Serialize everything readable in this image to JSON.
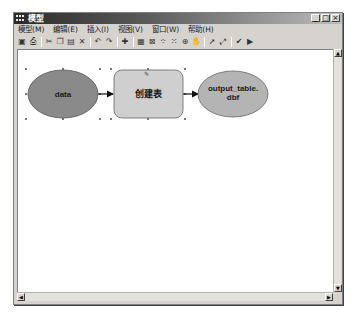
{
  "window": {
    "title": "模型",
    "controls": {
      "minimize": "_",
      "maximize": "□",
      "close": "×"
    }
  },
  "menubar": {
    "items": [
      {
        "label": "模型(M)"
      },
      {
        "label": "编辑(E)"
      },
      {
        "label": "插入(I)"
      },
      {
        "label": "视图(V)"
      },
      {
        "label": "窗口(W)"
      },
      {
        "label": "帮助(H)"
      }
    ]
  },
  "toolbar": {
    "groups": [
      [
        {
          "icon": "save-icon",
          "glyph": "▣"
        },
        {
          "icon": "print-icon",
          "glyph": "⎙"
        }
      ],
      [
        {
          "icon": "cut-icon",
          "glyph": "✂"
        },
        {
          "icon": "copy-icon",
          "glyph": "❐"
        },
        {
          "icon": "paste-icon",
          "glyph": "▤"
        },
        {
          "icon": "delete-icon",
          "glyph": "✕"
        }
      ],
      [
        {
          "icon": "undo-icon",
          "glyph": "↶"
        },
        {
          "icon": "redo-icon",
          "glyph": "↷"
        }
      ],
      [
        {
          "icon": "add-data-icon",
          "glyph": "✚"
        }
      ],
      [
        {
          "icon": "auto-layout-icon",
          "glyph": "▦"
        },
        {
          "icon": "full-extent-icon",
          "glyph": "⊠"
        },
        {
          "icon": "zoom-in-fixed-icon",
          "glyph": "⁘"
        },
        {
          "icon": "zoom-out-fixed-icon",
          "glyph": "⁙"
        },
        {
          "icon": "zoom-icon",
          "glyph": "⊕"
        },
        {
          "icon": "pan-icon",
          "glyph": "✋"
        }
      ],
      [
        {
          "icon": "select-icon",
          "glyph": "➚"
        },
        {
          "icon": "connect-icon",
          "glyph": "⤢"
        }
      ],
      [
        {
          "icon": "validate-icon",
          "glyph": "✔"
        },
        {
          "icon": "run-icon",
          "glyph": "▶"
        }
      ]
    ]
  },
  "diagram": {
    "nodes": [
      {
        "id": "data",
        "type": "input-data",
        "label": "data",
        "shape": "ellipse",
        "color": "#8a8a8a",
        "selected": true
      },
      {
        "id": "create-table",
        "type": "tool",
        "label": "创建表",
        "shape": "rounded-rect",
        "color": "#cfcfcf",
        "selected": true
      },
      {
        "id": "output",
        "type": "output-data",
        "label_lines": [
          "output_table.",
          "dbf"
        ],
        "shape": "ellipse",
        "color": "#b4b4b4",
        "selected": false
      }
    ],
    "edges": [
      {
        "from": "data",
        "to": "create-table"
      },
      {
        "from": "create-table",
        "to": "output"
      }
    ]
  },
  "scrollbars": {
    "up": "▲",
    "down": "▼",
    "left": "◀",
    "right": "▶"
  }
}
